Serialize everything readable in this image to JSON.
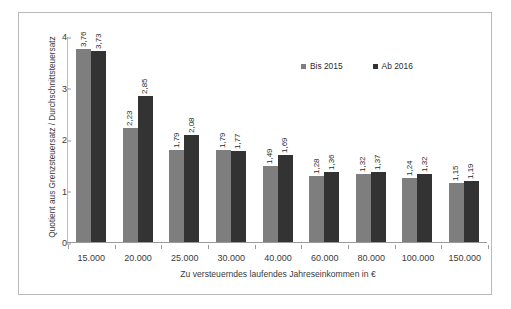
{
  "chart_data": {
    "type": "bar",
    "title": "",
    "xlabel": "Zu versteuerndes laufendes Jahreseinkommen in €",
    "ylabel": "Quotient aus Grenzsteuersatz / Durchschnittsteuersatz",
    "ylim": [
      0,
      4
    ],
    "yticks": [
      "0",
      "1",
      "2",
      "3",
      "4"
    ],
    "grid": false,
    "legend_position": "top-right",
    "categories": [
      "15.000",
      "20.000",
      "25.000",
      "30.000",
      "40.000",
      "60.000",
      "80.000",
      "100.000",
      "150.000"
    ],
    "series": [
      {
        "name": "Bis 2015",
        "color": "#7e7e7e",
        "values": [
          3.76,
          2.23,
          1.79,
          1.79,
          1.49,
          1.28,
          1.32,
          1.24,
          1.15
        ],
        "labels": [
          "3,76",
          "2,23",
          "1,79",
          "1,79",
          "1,49",
          "1,28",
          "1,32",
          "1,24",
          "1,15"
        ]
      },
      {
        "name": "Ab 2016",
        "color": "#333333",
        "values": [
          3.73,
          2.85,
          2.08,
          1.77,
          1.69,
          1.36,
          1.37,
          1.32,
          1.19
        ],
        "labels": [
          "3,73",
          "2,85",
          "2,08",
          "1,77",
          "1,69",
          "1,36",
          "1,37",
          "1,32",
          "1,19"
        ]
      }
    ]
  },
  "legend": {
    "items": [
      {
        "label": "Bis 2015",
        "swatch": "series-a"
      },
      {
        "label": "Ab 2016",
        "swatch": "series-b"
      }
    ]
  },
  "colors": {
    "series_a": "#7e7e7e",
    "series_b": "#333333",
    "frame_border": "#b9b9b9",
    "axis": "#9a9a9a",
    "text": "#3a3a3a",
    "background": "#ffffff"
  }
}
